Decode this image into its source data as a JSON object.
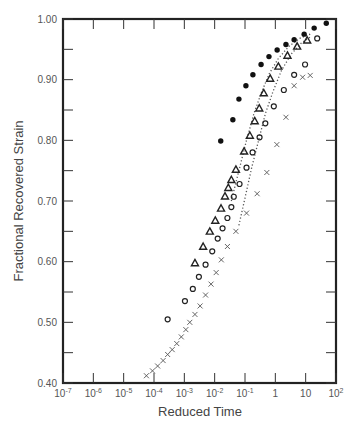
{
  "chart_data": {
    "type": "scatter",
    "title": "",
    "xlabel": "Reduced Time",
    "ylabel": "Fractional Recovered Strain",
    "xscale": "log",
    "xlim": [
      1e-07,
      100
    ],
    "ylim": [
      0.4,
      1.0
    ],
    "x_tick_labels": [
      "10-7",
      "10-6",
      "10-5",
      "10-4",
      "10-3",
      "10-2",
      "10-1",
      "1",
      "10",
      "102"
    ],
    "x_tick_exponents": [
      -7,
      -6,
      -5,
      -4,
      -3,
      -2,
      -1,
      0,
      1,
      2
    ],
    "y_tick_labels": [
      "0.40",
      "0.50",
      "0.60",
      "0.70",
      "0.80",
      "0.90",
      "1.00"
    ],
    "y_ticks": [
      0.4,
      0.5,
      0.6,
      0.7,
      0.8,
      0.9,
      1.0
    ],
    "grid": false,
    "legend": null,
    "series": [
      {
        "name": "filled circles",
        "marker": "filled-circle",
        "log10_x": [
          -1.8,
          -1.4,
          -1.2,
          -0.97,
          -0.74,
          -0.47,
          -0.21,
          0.06,
          0.35,
          0.62,
          0.95,
          1.28,
          1.68
        ],
        "y": [
          0.799,
          0.834,
          0.868,
          0.89,
          0.908,
          0.925,
          0.938,
          0.949,
          0.958,
          0.966,
          0.975,
          0.985,
          0.993
        ]
      },
      {
        "name": "open triangles",
        "marker": "open-triangle",
        "log10_x": [
          -2.65,
          -2.38,
          -2.16,
          -1.98,
          -1.79,
          -1.66,
          -1.55,
          -1.45,
          -1.3,
          -1.03,
          -0.84,
          -0.68,
          -0.53,
          -0.38,
          -0.17,
          0.1,
          0.4,
          0.72,
          1.05
        ],
        "y": [
          0.598,
          0.625,
          0.65,
          0.668,
          0.688,
          0.708,
          0.722,
          0.735,
          0.752,
          0.782,
          0.808,
          0.832,
          0.853,
          0.878,
          0.902,
          0.922,
          0.94,
          0.955,
          0.965
        ]
      },
      {
        "name": "open circles",
        "marker": "open-circle",
        "log10_x": [
          -3.55,
          -2.98,
          -2.72,
          -2.52,
          -2.3,
          -2.08,
          -1.9,
          -1.74,
          -1.58,
          -1.45,
          -1.37,
          -1.18,
          -0.95,
          -0.75,
          -0.52,
          -0.33,
          -0.05,
          0.28,
          0.62,
          0.98,
          1.38
        ],
        "y": [
          0.505,
          0.535,
          0.555,
          0.575,
          0.595,
          0.617,
          0.638,
          0.655,
          0.672,
          0.69,
          0.707,
          0.728,
          0.755,
          0.78,
          0.805,
          0.828,
          0.856,
          0.883,
          0.908,
          0.925,
          0.968
        ]
      },
      {
        "name": "crosses",
        "marker": "cross",
        "log10_x": [
          -4.25,
          -4.05,
          -3.88,
          -3.7,
          -3.55,
          -3.4,
          -3.25,
          -3.1,
          -2.95,
          -2.82,
          -2.65,
          -2.48,
          -2.3,
          -2.12,
          -1.95,
          -1.78,
          -1.58,
          -1.3,
          -0.95,
          -0.6,
          -0.28,
          0.05,
          0.35,
          0.62,
          0.9,
          1.15
        ],
        "y": [
          0.412,
          0.42,
          0.428,
          0.437,
          0.447,
          0.455,
          0.465,
          0.476,
          0.488,
          0.5,
          0.513,
          0.527,
          0.545,
          0.563,
          0.582,
          0.603,
          0.625,
          0.65,
          0.68,
          0.712,
          0.747,
          0.793,
          0.838,
          0.89,
          0.904,
          0.907
        ]
      },
      {
        "name": "dotted curve 1",
        "marker": "dotted-line",
        "log10_x": [
          -1.45,
          -1.2,
          -0.95,
          -0.7,
          -0.45,
          -0.2,
          0.1,
          0.45,
          0.8,
          1.15
        ],
        "y": [
          0.7,
          0.75,
          0.8,
          0.845,
          0.88,
          0.91,
          0.935,
          0.955,
          0.968,
          0.975
        ]
      },
      {
        "name": "dotted curve 2",
        "marker": "dotted-line",
        "log10_x": [
          -1.2,
          -1.0,
          -0.78,
          -0.55,
          -0.32,
          -0.08,
          0.2,
          0.52,
          0.85,
          1.2
        ],
        "y": [
          0.66,
          0.705,
          0.755,
          0.8,
          0.845,
          0.88,
          0.915,
          0.942,
          0.96,
          0.972
        ]
      }
    ]
  }
}
